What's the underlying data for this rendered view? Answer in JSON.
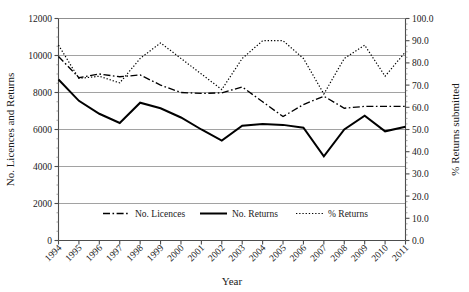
{
  "chart_data": {
    "type": "line",
    "title": "",
    "xlabel": "Year",
    "ylabel": "No. Licences and Returns",
    "y2label": "% Returns submitted",
    "ylim": [
      0,
      12000
    ],
    "y2lim": [
      0,
      100
    ],
    "ytick_labels": [
      "0",
      "2000",
      "4000",
      "6000",
      "8000",
      "10000",
      "12000"
    ],
    "ytick_values": [
      0,
      2000,
      4000,
      6000,
      8000,
      10000,
      12000
    ],
    "y2tick_labels": [
      "0.0",
      "10.0",
      "20.0",
      "30.0",
      "40.0",
      "50.0",
      "60.0",
      "70.0",
      "80.0",
      "90.0",
      "100.0"
    ],
    "y2tick_values": [
      0,
      10,
      20,
      30,
      40,
      50,
      60,
      70,
      80,
      90,
      100
    ],
    "grid": true,
    "grid_axis": "y",
    "legend_position": "bottom-inside",
    "categories": [
      "1994",
      "1995",
      "1996",
      "1997",
      "1998",
      "1999",
      "2000",
      "2001",
      "2002",
      "2003",
      "2004",
      "2005",
      "2006",
      "2007",
      "2008",
      "2009",
      "2010",
      "2011"
    ],
    "series": [
      {
        "name": "No. Licences",
        "axis": "left",
        "style": "dash-dot",
        "color": "#000000",
        "values": [
          9950,
          8800,
          9000,
          8850,
          8950,
          8400,
          8000,
          7950,
          7980,
          8300,
          7500,
          6700,
          7350,
          7800,
          7150,
          7250,
          7250,
          7250
        ]
      },
      {
        "name": "No. Returns",
        "axis": "left",
        "style": "solid",
        "color": "#000000",
        "values": [
          8700,
          7550,
          6850,
          6350,
          7450,
          7150,
          6650,
          6000,
          5400,
          6200,
          6300,
          6250,
          6100,
          4550,
          6000,
          6750,
          5900,
          6150
        ]
      },
      {
        "name": "% Returns",
        "axis": "right",
        "style": "dotted",
        "color": "#000000",
        "values": [
          88.0,
          73.0,
          74.0,
          71.0,
          82.0,
          89.0,
          82.0,
          75.0,
          68.0,
          82.0,
          90.0,
          90.0,
          82.0,
          66.0,
          82.0,
          88.0,
          74.0,
          85.0
        ]
      }
    ]
  },
  "legend": {
    "items": [
      {
        "label": "No. Licences",
        "style": "dash-dot"
      },
      {
        "label": "No. Returns",
        "style": "solid"
      },
      {
        "label": "% Returns",
        "style": "dotted"
      }
    ]
  }
}
